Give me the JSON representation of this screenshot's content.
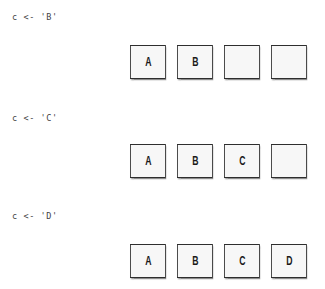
{
  "steps": [
    {
      "code": "c <- 'B'",
      "cells": [
        "A",
        "B",
        "",
        ""
      ]
    },
    {
      "code": "c <- 'C'",
      "cells": [
        "A",
        "B",
        "C",
        ""
      ]
    },
    {
      "code": "c <- 'D'",
      "cells": [
        "A",
        "B",
        "C",
        "D"
      ]
    }
  ],
  "colors": {
    "cell_border": "#2e2e2e",
    "cell_fill": "#f7f7f7",
    "code_text": "#444444",
    "cell_text": "#1a1a1a"
  }
}
